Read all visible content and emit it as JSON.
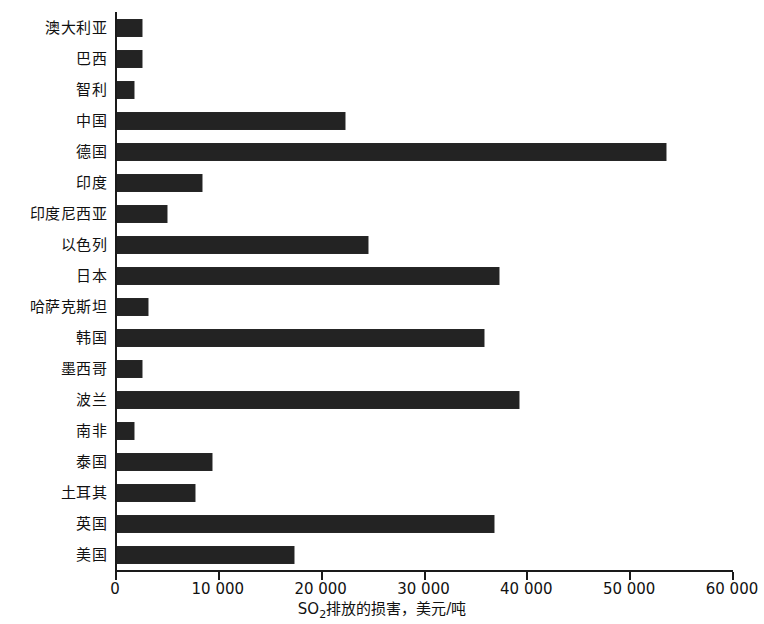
{
  "chart_data": {
    "type": "bar",
    "orientation": "horizontal",
    "title": "",
    "subtitle": "",
    "xlabel_parts": {
      "prefix": "SO",
      "subscript": "2",
      "suffix": "排放的损害，美元/吨"
    },
    "xlabel": "SO₂排放的损害，美元/吨",
    "ylabel": "",
    "xlim": [
      0,
      60000
    ],
    "xticks": [
      0,
      10000,
      20000,
      30000,
      40000,
      50000,
      60000
    ],
    "xticklabels": [
      "0",
      "10 000",
      "20 000",
      "30 000",
      "40 000",
      "50 000",
      "60 000"
    ],
    "grid": false,
    "legend": false,
    "bar_color": "#232323",
    "axis_color": "#1a1a1a",
    "categories": [
      "澳大利亚",
      "巴西",
      "智利",
      "中国",
      "德国",
      "印度",
      "印度尼西亚",
      "以色列",
      "日本",
      "哈萨克斯坦",
      "韩国",
      "墨西哥",
      "波兰",
      "南非",
      "泰国",
      "土耳其",
      "英国",
      "美国"
    ],
    "values": [
      2400,
      2400,
      1700,
      22200,
      53400,
      8300,
      4900,
      24400,
      37100,
      3000,
      35700,
      2400,
      39100,
      1700,
      9200,
      7600,
      36700,
      17200
    ]
  }
}
